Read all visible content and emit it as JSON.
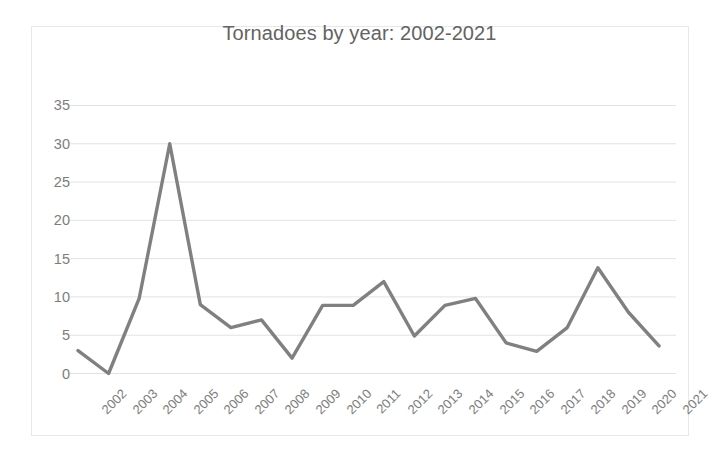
{
  "chart_data": {
    "type": "line",
    "title": "Tornadoes by year: 2002-2021",
    "xlabel": "",
    "ylabel": "",
    "categories": [
      "2002",
      "2003",
      "2004",
      "2005",
      "2006",
      "2007",
      "2008",
      "2009",
      "2010",
      "2011",
      "2012",
      "2013",
      "2014",
      "2015",
      "2016",
      "2017",
      "2018",
      "2019",
      "2020",
      "2021"
    ],
    "values": [
      3,
      0,
      9.8,
      30,
      9,
      6,
      7,
      2,
      8.9,
      8.9,
      12,
      4.9,
      8.9,
      9.8,
      4,
      2.9,
      6,
      13.8,
      8,
      3.6
    ],
    "series": [
      {
        "name": "Tornadoes",
        "values": [
          3,
          0,
          9.8,
          30,
          9,
          6,
          7,
          2,
          8.9,
          8.9,
          12,
          4.9,
          8.9,
          9.8,
          4,
          2.9,
          6,
          13.8,
          8,
          3.6
        ]
      }
    ],
    "ylim": [
      0,
      36.5
    ],
    "y_ticks": [
      0,
      5,
      10,
      15,
      20,
      25,
      30,
      35
    ],
    "y_tick_labels": [
      "0",
      "5",
      "10",
      "15",
      "20",
      "25",
      "30",
      "35"
    ],
    "grid": true,
    "grid_axis": "y",
    "legend": false,
    "legend_position": "none",
    "line_color": "#808080",
    "grid_color": "#e2e2e2",
    "frame_color": "#e8e8e8",
    "title_color": "#636363",
    "tick_label_color": "#7d7d7d",
    "background_color": "#ffffff",
    "x_tick_rotation": -45
  }
}
